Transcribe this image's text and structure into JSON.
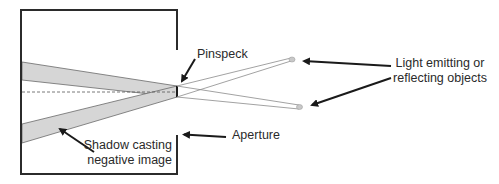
{
  "diagram": {
    "labels": {
      "pinspeck": "Pinspeck",
      "aperture": "Aperture",
      "objects_line1": "Light emitting or",
      "objects_line2": "reflecting objects",
      "shadow_line1": "Shadow casting",
      "shadow_line2": "negative image"
    },
    "colors": {
      "box_stroke": "#2b2b2b",
      "shadow_fill": "#d6d6d6",
      "shadow_stroke": "#6a6a6a",
      "ray_stroke": "#8a8a8a",
      "object_fill": "#c8c8c8",
      "arrow": "#1a1a1a",
      "text": "#2a2a2a"
    },
    "elements": {
      "box": "camera-box",
      "pinspeck": "pinspeck-occluder",
      "aperture": "aperture-opening",
      "objects": [
        "upper-light-object",
        "lower-light-object"
      ],
      "shadows": [
        "upper-shadow",
        "lower-shadow"
      ],
      "axis": "optical-axis-dashed"
    }
  }
}
